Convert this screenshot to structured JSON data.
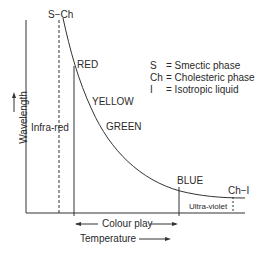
{
  "diagram": {
    "title_phase_transitions": {
      "s_ch": "S−Ch",
      "ch_i": "Ch−I"
    },
    "colour_labels": [
      "RED",
      "YELLOW",
      "GREEN",
      "BLUE"
    ],
    "region_labels": {
      "infra_red": "Infra-red",
      "ultra_violet": "Ultra-violet",
      "colour_play": "Colour play"
    },
    "axes": {
      "ylabel": "Wavelength",
      "xlabel": "Temperature"
    },
    "legend": [
      {
        "symbol": "S",
        "text": "= Smectic phase"
      },
      {
        "symbol": "Ch",
        "text": "= Cholesteric phase"
      },
      {
        "symbol": "I",
        "text": "= Isotropic liquid"
      }
    ]
  }
}
